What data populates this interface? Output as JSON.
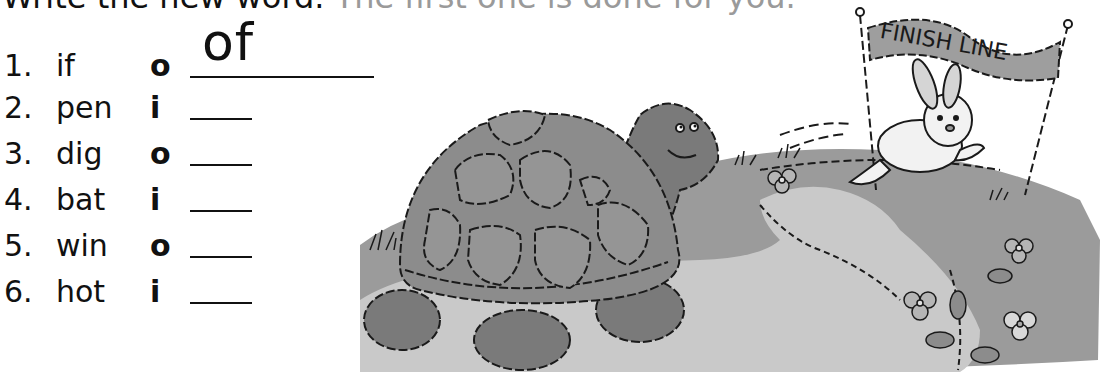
{
  "header": {
    "instruction": "Write the new word.",
    "instruction_faded": "The first one is done for you."
  },
  "exercise": {
    "items": [
      {
        "number": "1.",
        "word": "if",
        "letter": "o",
        "answer": "of"
      },
      {
        "number": "2.",
        "word": "pen",
        "letter": "i",
        "answer": ""
      },
      {
        "number": "3.",
        "word": "dig",
        "letter": "o",
        "answer": ""
      },
      {
        "number": "4.",
        "word": "bat",
        "letter": "i",
        "answer": ""
      },
      {
        "number": "5.",
        "word": "win",
        "letter": "o",
        "answer": ""
      },
      {
        "number": "6.",
        "word": "hot",
        "letter": "i",
        "answer": ""
      }
    ]
  },
  "illustration": {
    "banner_text": "FINISH LINE",
    "characters": [
      "turtle",
      "rabbit"
    ],
    "colors": {
      "shell": "#8c8c8c",
      "skin": "#7a7a7a",
      "grass": "#9b9b9b",
      "path": "#c9c9c9",
      "outline": "#1a1a1a"
    }
  }
}
